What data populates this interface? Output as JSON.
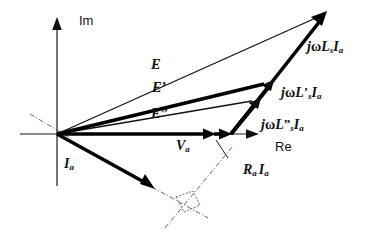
{
  "figure": {
    "kind": "phasor-diagram",
    "background_color": "#ffffff",
    "ink_color": "#111111",
    "construction_color": "#555555"
  },
  "axes": {
    "imaginary": {
      "label": "Im",
      "orientation": "vertical",
      "arrow": "up"
    },
    "real": {
      "label": "Re",
      "orientation": "horizontal",
      "arrow": "right"
    },
    "origin": {
      "x": 57,
      "y": 134
    }
  },
  "phasors": [
    {
      "id": "E",
      "label": "E",
      "label_html": "E",
      "weight": "thin",
      "from": {
        "x": 57,
        "y": 134
      },
      "to": {
        "x": 326,
        "y": 13
      },
      "label_pos": {
        "x": 151,
        "y": 57
      }
    },
    {
      "id": "E-prime",
      "label": "E'",
      "label_html": "E<span class=\"prime\">&#8217;</span>",
      "weight": "thick",
      "from": {
        "x": 57,
        "y": 134
      },
      "to": {
        "x": 272,
        "y": 82
      },
      "label_pos": {
        "x": 152,
        "y": 80
      }
    },
    {
      "id": "E-double-prime",
      "label": "E\"",
      "label_html": "E<span class=\"prime\">&#8221;</span>",
      "weight": "thin",
      "from": {
        "x": 57,
        "y": 134
      },
      "to": {
        "x": 259,
        "y": 100
      },
      "label_pos": {
        "x": 151,
        "y": 106
      }
    },
    {
      "id": "Va",
      "label": "Va",
      "label_html": "V<sub>a</sub>",
      "weight": "thick",
      "from": {
        "x": 57,
        "y": 134
      },
      "to": {
        "x": 214,
        "y": 134
      },
      "label_pos": {
        "x": 176,
        "y": 139
      }
    },
    {
      "id": "RaIa",
      "label": "Ra Ia",
      "label_html": "R<sub>a</sub><span class=\"gap\"></span>I<sub>a</sub>",
      "weight": "thick",
      "from": {
        "x": 214,
        "y": 134
      },
      "to": {
        "x": 231,
        "y": 134
      },
      "label_pos": {
        "x": 243,
        "y": 163
      }
    },
    {
      "id": "Ia",
      "label": "Ia",
      "label_html": "I<sub>a</sub>",
      "weight": "thick",
      "from": {
        "x": 57,
        "y": 134
      },
      "to": {
        "x": 152,
        "y": 187
      },
      "label_pos": {
        "x": 64,
        "y": 157
      }
    },
    {
      "id": "jwLsIa",
      "label": "jwLs Ia",
      "label_html": "j<span class=\"upr\">&#969;</span>L<sub>s</sub>I<sub>a</sub>",
      "weight": "thick",
      "from": {
        "x": 231,
        "y": 134
      },
      "to": {
        "x": 326,
        "y": 13
      },
      "label_pos": {
        "x": 307,
        "y": 40
      }
    },
    {
      "id": "jwLsPrimeIa",
      "label": "jwL's Ia",
      "label_html": "j<span class=\"upr\">&#969;</span>L<span class=\"prime\">&#8217;</span><sub>s</sub>I<sub>a</sub>",
      "weight": "thick",
      "from": {
        "x": 231,
        "y": 134
      },
      "to": {
        "x": 272,
        "y": 82
      },
      "label_pos": {
        "x": 281,
        "y": 85
      }
    },
    {
      "id": "jwLsDoublePrimeIa",
      "label": "jwL''s Ia",
      "label_html": "j<span class=\"upr\">&#969;</span>L<span class=\"prime\">&#8221;</span><sub>s</sub>I<sub>a</sub>",
      "weight": "thick",
      "from": {
        "x": 231,
        "y": 134
      },
      "to": {
        "x": 259,
        "y": 100
      },
      "label_pos": {
        "x": 261,
        "y": 117
      }
    }
  ],
  "construction": {
    "q_axis_line": {
      "x1": 30,
      "y1": 114,
      "x2": 72,
      "y2": 139
    },
    "current_extension": {
      "x1": 152,
      "y1": 187,
      "x2": 208,
      "y2": 218
    },
    "perpendicular_line": {
      "x1": 165,
      "y1": 228,
      "x2": 233,
      "y2": 146
    },
    "right_angle_marker": [
      {
        "x": 176,
        "y": 197
      },
      {
        "x": 193,
        "y": 191
      },
      {
        "x": 200,
        "y": 205
      },
      {
        "x": 184,
        "y": 212
      }
    ],
    "pointer_to_RaIa": {
      "x1": 228,
      "y1": 158,
      "x2": 216,
      "y2": 140
    }
  },
  "legend_note": ""
}
